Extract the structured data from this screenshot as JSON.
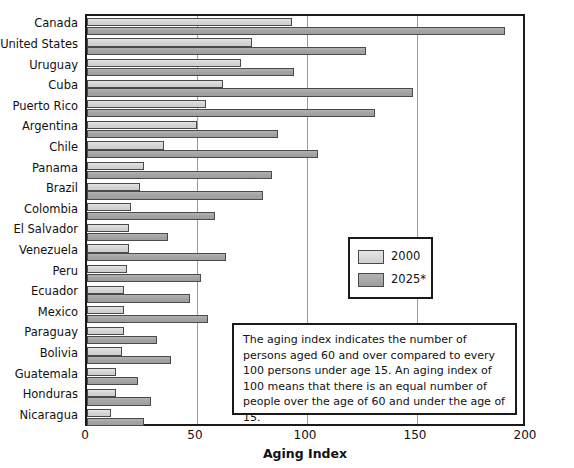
{
  "chart_data": {
    "type": "bar",
    "orientation": "horizontal",
    "title": "",
    "xlabel": "Aging Index",
    "ylabel": "",
    "xlim": [
      0,
      200
    ],
    "xticks": [
      0,
      50,
      100,
      150,
      200
    ],
    "grid": true,
    "legend_position": "center-right",
    "categories": [
      "Canada",
      "United States",
      "Uruguay",
      "Cuba",
      "Puerto Rico",
      "Argentina",
      "Chile",
      "Panama",
      "Brazil",
      "Colombia",
      "El Salvador",
      "Venezuela",
      "Peru",
      "Ecuador",
      "Mexico",
      "Paraguay",
      "Bolivia",
      "Guatemala",
      "Honduras",
      "Nicaragua"
    ],
    "series": [
      {
        "name": "2000",
        "color": "#d5d5d5",
        "values": [
          93,
          75,
          70,
          62,
          54,
          50,
          35,
          26,
          24,
          20,
          19,
          19,
          18,
          17,
          17,
          17,
          16,
          13,
          13,
          11
        ]
      },
      {
        "name": "2025*",
        "color": "#a2a2a2",
        "values": [
          190,
          127,
          94,
          148,
          131,
          87,
          105,
          84,
          80,
          58,
          37,
          63,
          52,
          47,
          55,
          32,
          38,
          23,
          29,
          26
        ]
      }
    ],
    "annotation": "The aging index indicates the number of persons aged 60 and over compared to every 100 persons under age 15. An aging index of 100 means that there is an equal number of people over the age of 60 and under the age of 15."
  },
  "legend": {
    "items": [
      {
        "label": "2000",
        "swatch": "s2000"
      },
      {
        "label": "2025*",
        "swatch": "s2025"
      }
    ]
  },
  "axis": {
    "x_title": "Aging Index",
    "tick_labels": [
      "0",
      "50",
      "100",
      "150",
      "200"
    ]
  }
}
